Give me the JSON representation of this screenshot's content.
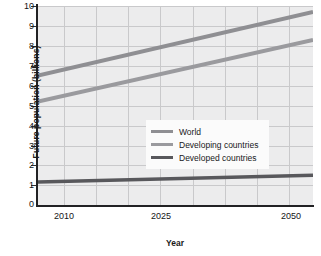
{
  "chart_data": {
    "type": "line",
    "title": "",
    "xlabel": "Year",
    "ylabel": "Future population (billions)",
    "xlim": [
      2008,
      2050
    ],
    "ylim": [
      0,
      10
    ],
    "xticks": [
      2010,
      2025,
      2050
    ],
    "yticks": [
      0,
      1,
      2,
      3,
      4,
      5,
      6,
      7,
      8,
      9,
      10
    ],
    "grid": true,
    "legend_position": "center",
    "x": [
      2008,
      2050
    ],
    "series": [
      {
        "name": "World",
        "color": "#8f8f93",
        "values": [
          6.5,
          9.7
        ]
      },
      {
        "name": "Developing countries",
        "color": "#9a9a9e",
        "values": [
          5.2,
          8.3
        ]
      },
      {
        "name": "Developed countries",
        "color": "#58585c",
        "values": [
          1.15,
          1.5
        ]
      }
    ]
  },
  "axes": {
    "y_title": "Future population (billions)",
    "x_title": "Year",
    "y_tick_labels": [
      "10",
      "9",
      "8",
      "7",
      "6",
      "5",
      "4",
      "3",
      "2",
      "1",
      "0"
    ],
    "x_tick_labels": [
      "2010",
      "2025",
      "2050"
    ]
  },
  "legend": {
    "items": [
      {
        "label": "World",
        "color": "#8f8f93"
      },
      {
        "label": "Developing countries",
        "color": "#9a9a9e"
      },
      {
        "label": "Developed countries",
        "color": "#58585c"
      }
    ]
  },
  "colors": {
    "plot_background": "#ececed",
    "gridline": "#c9c9cb",
    "axis": "#222224",
    "text": "#141416"
  }
}
